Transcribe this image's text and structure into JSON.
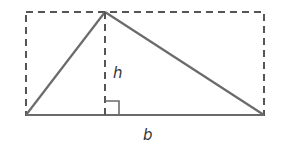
{
  "diagram": {
    "title": "",
    "labels": {
      "height": "h",
      "base": "b"
    },
    "colors": {
      "stroke": "#6b6b6b",
      "dashed": "#555555",
      "text": "#333333",
      "background": "#ffffff"
    },
    "shapes": {
      "bounding_rectangle": {
        "style": "dashed",
        "x1": 26,
        "y1": 12,
        "x2": 264,
        "y2": 115
      },
      "triangle": {
        "vertices": [
          [
            26,
            115
          ],
          [
            105,
            12
          ],
          [
            264,
            115
          ]
        ]
      },
      "height_line": {
        "style": "dashed",
        "x": 105,
        "y1": 12,
        "y2": 115
      },
      "right_angle_marker": {
        "x": 105,
        "y": 101,
        "size": 14
      }
    }
  }
}
